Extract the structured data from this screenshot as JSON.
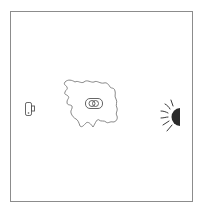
{
  "diagram": {
    "frame": {
      "border_color": "#8c8c8c",
      "background": "#ffffff"
    },
    "elements": [
      {
        "id": "camera",
        "icon": "camera-icon",
        "position": "left",
        "stroke": "#555555"
      },
      {
        "id": "medium",
        "icon": "irregular-blob-outline",
        "position": "center",
        "stroke": "#666666"
      },
      {
        "id": "object",
        "icon": "object-in-box-icon",
        "position": "center-inside-blob",
        "stroke": "#555555"
      },
      {
        "id": "light-source",
        "icon": "half-sun-icon",
        "position": "right",
        "fill": "#2b2b2b"
      }
    ],
    "labels": []
  }
}
